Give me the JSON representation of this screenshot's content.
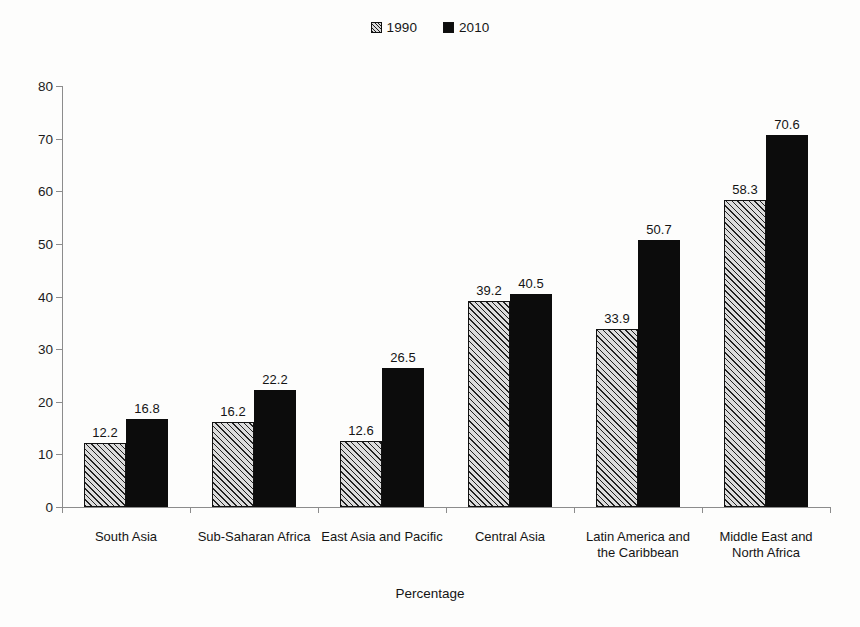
{
  "chart_data": {
    "type": "bar",
    "title": "",
    "subtitle": "",
    "xlabel": "Percentage",
    "ylabel": "",
    "ylim": [
      0,
      80
    ],
    "yticks": [
      0,
      10,
      20,
      30,
      40,
      50,
      60,
      70,
      80
    ],
    "grid": false,
    "legend_position": "top-center",
    "categories": [
      "South Asia",
      "Sub-Saharan Africa",
      "East Asia and Pacific",
      "Central Asia",
      "Latin America and\nthe Caribbean",
      "Middle East and\nNorth Africa"
    ],
    "series": [
      {
        "name": "1990",
        "fill": "diagonal-hatch",
        "color": "#dcdcdc",
        "values": [
          12.2,
          16.2,
          12.6,
          39.2,
          33.9,
          58.3
        ]
      },
      {
        "name": "2010",
        "fill": "solid",
        "color": "#0c0c0c",
        "values": [
          16.8,
          22.2,
          26.5,
          40.5,
          50.7,
          70.6
        ]
      }
    ]
  },
  "legend": {
    "items": [
      {
        "label": "1990",
        "swatch": "hatched-swatch"
      },
      {
        "label": "2010",
        "swatch": "solid-swatch"
      }
    ]
  },
  "axis": {
    "x_title": "Percentage"
  }
}
